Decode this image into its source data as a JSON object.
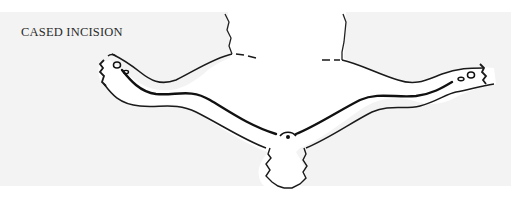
{
  "figure": {
    "caption": "CASED INCISION",
    "incision_line": "belly-to-hind-legs",
    "colors": {
      "background_panel": "#f3f3f3",
      "page": "#ffffff",
      "ink": "#1a1a1a",
      "pelt_fill": "#ffffff"
    }
  }
}
